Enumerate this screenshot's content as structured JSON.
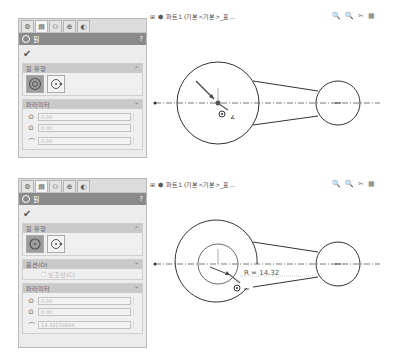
{
  "tabs": [
    {
      "icon": "feature-manager-icon"
    },
    {
      "icon": "property-manager-icon"
    },
    {
      "icon": "configuration-manager-icon"
    },
    {
      "icon": "dimxpert-icon"
    },
    {
      "icon": "display-manager-icon"
    }
  ],
  "panel_top": {
    "title": "원",
    "help": "?",
    "ok": "✔",
    "type_group": "원 유형",
    "param_group": "파라미터",
    "params": [
      "0.00",
      "0.00",
      "0.00"
    ],
    "collapse": "⌃"
  },
  "panel_bottom": {
    "title": "원",
    "help": "?",
    "ok": "✔",
    "type_group": "원 유형",
    "option_group": "옵션(O)",
    "option_label": "보조선(C)",
    "param_group": "파라미터",
    "params": [
      "0.00",
      "0.00",
      "14.32239494"
    ],
    "collapse": "⌃"
  },
  "document": {
    "title": "파트1 (기본<기본>_표...",
    "expand": "⊞"
  },
  "view_tools": [
    "🔍",
    "🔍",
    "✂",
    "▦"
  ],
  "sketch": {
    "radius_label": "R = 14.32"
  }
}
